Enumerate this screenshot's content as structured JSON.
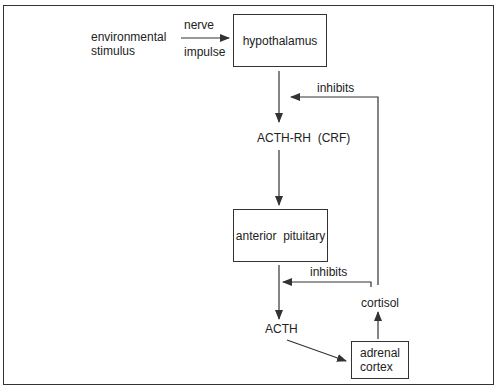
{
  "diagram": {
    "title": "",
    "nodes": {
      "environmental_stimulus": {
        "line1": "environmental",
        "line2": "stimulus"
      },
      "hypothalamus": "hypothalamus",
      "acth_rh": "ACTH-RH  (CRF)",
      "anterior_pituitary": "anterior  pituitary",
      "acth": "ACTH",
      "adrenal_cortex": {
        "line1": "adrenal",
        "line2": "cortex"
      },
      "cortisol": "cortisol"
    },
    "edge_labels": {
      "nerve": "nerve",
      "impulse": "impulse",
      "inhibits_top": "inhibits",
      "inhibits_bottom": "inhibits"
    },
    "edges": [
      {
        "from": "environmental stimulus",
        "to": "hypothalamus",
        "label": "nerve impulse"
      },
      {
        "from": "hypothalamus",
        "to": "ACTH-RH (CRF)"
      },
      {
        "from": "ACTH-RH (CRF)",
        "to": "anterior pituitary"
      },
      {
        "from": "anterior pituitary",
        "to": "ACTH"
      },
      {
        "from": "ACTH",
        "to": "adrenal cortex"
      },
      {
        "from": "adrenal cortex",
        "to": "cortisol"
      },
      {
        "from": "cortisol",
        "to": "hypothalamus pathway",
        "label": "inhibits"
      },
      {
        "from": "cortisol",
        "to": "anterior pituitary pathway",
        "label": "inhibits"
      }
    ],
    "colors": {
      "line": "#333333",
      "background": "#ffffff"
    }
  }
}
